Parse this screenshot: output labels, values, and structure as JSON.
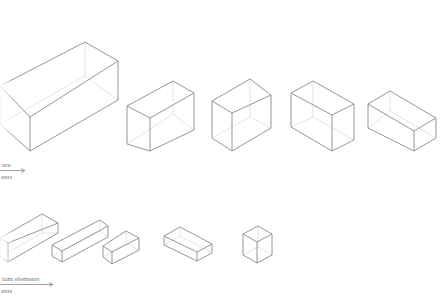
{
  "diagram": {
    "type": "isometric-box-series",
    "stroke_color": "#8a8a8a",
    "hidden_stroke_color": "#d8d8d8",
    "background": "#ffffff"
  },
  "rows": [
    {
      "label_line1": "ure",
      "label_line2": "ents",
      "arrow": "→",
      "boxes": [
        {
          "name": "large-box",
          "top": [
            85,
            42
          ],
          "r_top": [
            118,
            61
          ],
          "r_bot": [
            118,
            100
          ],
          "f_top": [
            30,
            117
          ],
          "f_bot": [
            30,
            151
          ],
          "l_top": [
            0,
            86
          ],
          "l_bot": [
            0,
            124
          ]
        },
        {
          "name": "box-2",
          "top": [
            173,
            81
          ],
          "r_top": [
            194,
            93
          ],
          "r_bot": [
            194,
            130
          ],
          "f_top": [
            150,
            118
          ],
          "f_bot": [
            150,
            151
          ],
          "l_top": [
            127,
            106
          ],
          "l_bot": [
            127,
            144
          ]
        },
        {
          "name": "box-3",
          "top": [
            250,
            79
          ],
          "r_top": [
            271,
            95
          ],
          "r_bot": [
            271,
            128
          ],
          "f_top": [
            232,
            113
          ],
          "f_bot": [
            232,
            151
          ],
          "l_top": [
            212,
            101
          ],
          "l_bot": [
            212,
            138
          ]
        },
        {
          "name": "box-4",
          "top": [
            313,
            81
          ],
          "r_top": [
            354,
            104
          ],
          "r_bot": [
            354,
            140
          ],
          "f_top": [
            332,
            115
          ],
          "f_bot": [
            332,
            151
          ],
          "l_top": [
            291,
            93
          ],
          "l_bot": [
            291,
            127
          ]
        },
        {
          "name": "box-5",
          "top": [
            390,
            91
          ],
          "r_top": [
            436,
            118
          ],
          "r_bot": [
            436,
            138
          ],
          "f_top": [
            414,
            131
          ],
          "f_bot": [
            414,
            151
          ],
          "l_top": [
            368,
            104
          ],
          "l_bot": [
            368,
            128
          ]
        }
      ]
    },
    {
      "label_line1": "ium elements",
      "label_line2": "ents",
      "arrow": "→",
      "boxes": [
        {
          "name": "bar-1",
          "top": [
            42,
            214
          ],
          "r_top": [
            58,
            223
          ],
          "r_bot": [
            58,
            233
          ],
          "f_top": [
            8,
            243
          ],
          "f_bot": [
            8,
            262
          ],
          "l_top": [
            0,
            238
          ],
          "l_bot": [
            0,
            257
          ]
        },
        {
          "name": "bar-2",
          "top": [
            100,
            220
          ],
          "r_top": [
            108,
            226
          ],
          "r_bot": [
            108,
            237
          ],
          "f_top": [
            62,
            251
          ],
          "f_bot": [
            62,
            262
          ],
          "l_top": [
            52,
            245
          ],
          "l_bot": [
            52,
            256
          ]
        },
        {
          "name": "bar-3",
          "top": [
            126,
            231
          ],
          "r_top": [
            139,
            238
          ],
          "r_bot": [
            139,
            250
          ],
          "f_top": [
            112,
            252
          ],
          "f_bot": [
            112,
            264
          ],
          "l_top": [
            103,
            246
          ],
          "l_bot": [
            103,
            257
          ]
        },
        {
          "name": "slab",
          "top": [
            180,
            227
          ],
          "r_top": [
            212,
            244
          ],
          "r_bot": [
            212,
            253
          ],
          "f_top": [
            197,
            252
          ],
          "f_bot": [
            197,
            261
          ],
          "l_top": [
            164,
            236
          ],
          "l_bot": [
            164,
            245
          ]
        },
        {
          "name": "cube",
          "top": [
            258,
            226
          ],
          "r_top": [
            272,
            234
          ],
          "r_bot": [
            272,
            255
          ],
          "f_top": [
            257,
            242
          ],
          "f_bot": [
            257,
            263
          ],
          "l_top": [
            243,
            234
          ],
          "l_bot": [
            243,
            255
          ]
        }
      ]
    }
  ]
}
